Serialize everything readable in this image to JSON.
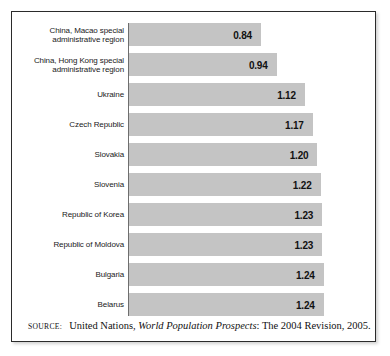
{
  "figure": {
    "source_kicker": "source:",
    "source_prefix": "United Nations, ",
    "source_title": "World Population Prospects",
    "source_suffix": ": The 2004 Revision, 2005.",
    "bar_color": "#c4c4c4",
    "border_color": "#2b2b2b"
  },
  "chart_data": {
    "type": "bar",
    "orientation": "horizontal",
    "title": "",
    "xlabel": "",
    "ylabel": "",
    "grid": false,
    "legend": null,
    "xlim": [
      0,
      1.4
    ],
    "categories": [
      "China, Macao special administrative region",
      "China, Hong Kong special administrative region",
      "Ukraine",
      "Czech Republic",
      "Slovakia",
      "Slovenia",
      "Republic of Korea",
      "Republic of Moldova",
      "Bulgaria",
      "Belarus"
    ],
    "values": [
      0.84,
      0.94,
      1.12,
      1.17,
      1.2,
      1.22,
      1.23,
      1.23,
      1.24,
      1.24
    ],
    "value_labels": [
      "0.84",
      "0.94",
      "1.12",
      "1.17",
      "1.20",
      "1.22",
      "1.23",
      "1.23",
      "1.24",
      "1.24"
    ]
  }
}
